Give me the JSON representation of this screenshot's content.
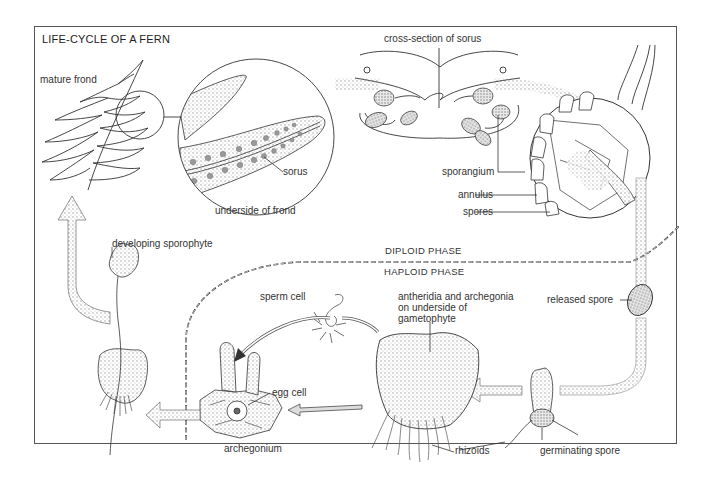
{
  "diagram": {
    "title": "LIFE-CYCLE OF A FERN",
    "phases": {
      "upper": "DIPLOID PHASE",
      "lower": "HAPLOID PHASE"
    },
    "labels": {
      "mature_frond": "mature frond",
      "sorus": "sorus",
      "underside_of_frond": "underside of frond",
      "cross_section_of_sorus": "cross-section of sorus",
      "sporangium": "sporangium",
      "annulus": "annulus",
      "spores": "spores",
      "developing_sporophyte": "developing sporophyte",
      "released_spore": "released spore",
      "sperm_cell": "sperm cell",
      "antheridia_line1": "antheridia and archegonia",
      "antheridia_line2": "on underside of",
      "antheridia_line3": "gametophyte",
      "egg_cell": "egg cell",
      "archegonium": "archegonium",
      "rhizoids": "rhizoids",
      "germinating_spore": "germinating spore"
    },
    "colors": {
      "line": "#333333",
      "stipple": "#bdbdbd",
      "frame": "#555555",
      "background": "#ffffff"
    }
  }
}
